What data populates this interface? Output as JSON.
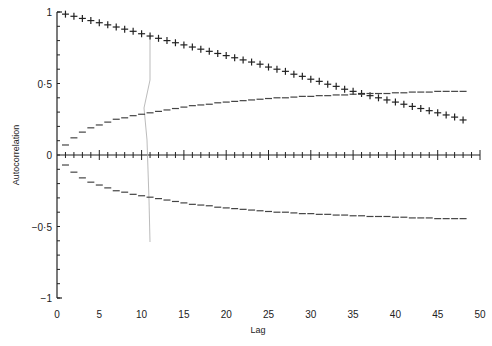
{
  "chart_data": {
    "type": "scatter",
    "title": "",
    "xlabel": "Lag",
    "ylabel": "Autocorrelation",
    "xlim": [
      0,
      50
    ],
    "ylim": [
      -1,
      1
    ],
    "grid": false,
    "legend": "none",
    "x_ticks": [
      0,
      5,
      10,
      15,
      20,
      25,
      30,
      35,
      40,
      45,
      50
    ],
    "x_tick_labels": [
      "0",
      "5",
      "10",
      "15",
      "20",
      "25",
      "30",
      "35",
      "40",
      "45",
      "50"
    ],
    "y_ticks": [
      -1,
      -0.5,
      0,
      0.5,
      1
    ],
    "y_tick_labels": [
      "−1",
      "−0·5",
      "0",
      "0·5",
      "1"
    ],
    "series": [
      {
        "name": "Sample autocorrelation",
        "marker": "+",
        "x": [
          1,
          2,
          3,
          4,
          5,
          6,
          7,
          8,
          9,
          10,
          11,
          12,
          13,
          14,
          15,
          16,
          17,
          18,
          19,
          20,
          21,
          22,
          23,
          24,
          25,
          26,
          27,
          28,
          29,
          30,
          31,
          32,
          33,
          34,
          35,
          36,
          37,
          38,
          39,
          40,
          41,
          42,
          43,
          44,
          45,
          46,
          47,
          48
        ],
        "values": [
          0.985,
          0.97,
          0.955,
          0.94,
          0.925,
          0.91,
          0.895,
          0.88,
          0.865,
          0.848,
          0.832,
          0.816,
          0.8,
          0.785,
          0.77,
          0.755,
          0.74,
          0.725,
          0.71,
          0.695,
          0.68,
          0.665,
          0.65,
          0.635,
          0.615,
          0.6,
          0.585,
          0.565,
          0.55,
          0.53,
          0.515,
          0.495,
          0.48,
          0.46,
          0.445,
          0.43,
          0.415,
          0.4,
          0.385,
          0.37,
          0.355,
          0.34,
          0.325,
          0.31,
          0.295,
          0.28,
          0.265,
          0.245
        ]
      },
      {
        "name": "Upper confidence band",
        "marker": "-",
        "x": [
          1,
          2,
          3,
          4,
          5,
          6,
          7,
          8,
          9,
          10,
          11,
          12,
          13,
          14,
          15,
          16,
          17,
          18,
          19,
          20,
          21,
          22,
          23,
          24,
          25,
          26,
          27,
          28,
          29,
          30,
          31,
          32,
          33,
          34,
          35,
          36,
          37,
          38,
          39,
          40,
          41,
          42,
          43,
          44,
          45,
          46,
          47,
          48
        ],
        "values": [
          0.07,
          0.12,
          0.16,
          0.19,
          0.21,
          0.23,
          0.25,
          0.26,
          0.275,
          0.285,
          0.295,
          0.305,
          0.315,
          0.325,
          0.335,
          0.345,
          0.35,
          0.355,
          0.365,
          0.37,
          0.375,
          0.38,
          0.385,
          0.39,
          0.395,
          0.4,
          0.4,
          0.405,
          0.41,
          0.41,
          0.415,
          0.415,
          0.42,
          0.42,
          0.425,
          0.425,
          0.43,
          0.43,
          0.43,
          0.435,
          0.435,
          0.44,
          0.44,
          0.44,
          0.445,
          0.445,
          0.445,
          0.445
        ]
      },
      {
        "name": "Lower confidence band",
        "marker": "-",
        "x": [
          1,
          2,
          3,
          4,
          5,
          6,
          7,
          8,
          9,
          10,
          11,
          12,
          13,
          14,
          15,
          16,
          17,
          18,
          19,
          20,
          21,
          22,
          23,
          24,
          25,
          26,
          27,
          28,
          29,
          30,
          31,
          32,
          33,
          34,
          35,
          36,
          37,
          38,
          39,
          40,
          41,
          42,
          43,
          44,
          45,
          46,
          47,
          48
        ],
        "values": [
          -0.07,
          -0.12,
          -0.16,
          -0.19,
          -0.21,
          -0.23,
          -0.25,
          -0.26,
          -0.275,
          -0.285,
          -0.295,
          -0.305,
          -0.315,
          -0.325,
          -0.335,
          -0.345,
          -0.35,
          -0.355,
          -0.365,
          -0.37,
          -0.375,
          -0.38,
          -0.385,
          -0.39,
          -0.395,
          -0.4,
          -0.4,
          -0.405,
          -0.41,
          -0.41,
          -0.415,
          -0.415,
          -0.42,
          -0.42,
          -0.425,
          -0.425,
          -0.43,
          -0.43,
          -0.43,
          -0.435,
          -0.435,
          -0.44,
          -0.44,
          -0.44,
          -0.445,
          -0.445,
          -0.445,
          -0.445
        ]
      }
    ]
  },
  "colors": {
    "ink": "#222222",
    "band": "#444444",
    "artifact": "#aaaaaa"
  }
}
